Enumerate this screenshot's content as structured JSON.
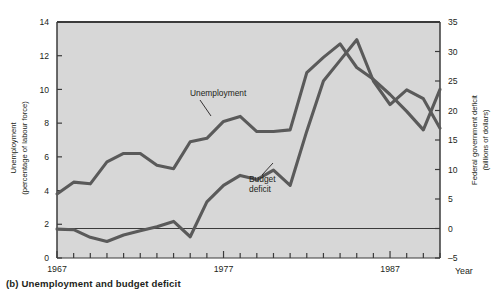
{
  "caption": "(b) Unemployment and budget deficit",
  "chart_data": {
    "type": "line",
    "title": "",
    "xlabel": "Year",
    "left_axis": {
      "label_line1": "Unemployment",
      "label_line2": "(percentage of labour force)",
      "ticks": [
        0,
        2,
        4,
        6,
        8,
        10,
        12,
        14
      ],
      "ylim": [
        0,
        14
      ]
    },
    "right_axis": {
      "label_line1": "Federal government deficit",
      "label_line2": "(billions of dollars)",
      "ticks": [
        -5,
        0,
        5,
        10,
        15,
        20,
        25,
        30,
        35
      ],
      "ylim": [
        -5,
        35
      ]
    },
    "x": [
      1967,
      1968,
      1969,
      1970,
      1971,
      1972,
      1973,
      1974,
      1975,
      1976,
      1977,
      1978,
      1979,
      1980,
      1981,
      1982,
      1983,
      1984,
      1985,
      1986,
      1987,
      1988,
      1989,
      1990
    ],
    "xlim": [
      1967,
      1990
    ],
    "xticklabels": [
      "1967",
      "1977",
      "1987"
    ],
    "xticklabel_years": [
      1967,
      1977,
      1987
    ],
    "grid": false,
    "legend": "inline-annotations",
    "series": [
      {
        "name": "Unemployment",
        "axis": "left",
        "units": "percentage of labour force",
        "annotation": "Unemployment",
        "values": [
          3.8,
          4.5,
          4.4,
          5.7,
          6.2,
          6.2,
          5.5,
          5.3,
          6.9,
          7.1,
          8.1,
          8.4,
          7.5,
          7.5,
          7.6,
          11.0,
          11.9,
          11.3,
          10.5,
          9.6,
          8.8,
          7.8,
          7.5,
          8.1
        ],
        "values_y2": [
          3.8,
          4.5,
          4.4,
          5.7,
          6.2,
          6.2,
          5.5,
          5.3,
          6.9,
          7.1,
          8.1,
          8.4,
          7.5,
          7.5,
          7.6,
          11.0,
          11.9,
          12.7,
          11.3,
          10.6,
          9.7,
          8.7,
          7.6,
          10.0
        ]
      },
      {
        "name": "Budget deficit",
        "axis": "right",
        "units": "billions of dollars",
        "annotation": "Budget deficit",
        "values": [
          -0.1,
          -0.2,
          -1.5,
          -2.2,
          -1.1,
          -0.4,
          0.3,
          1.2,
          -1.4,
          4.5,
          7.3,
          9.0,
          8.3,
          9.9,
          7.3,
          16.5,
          25.0,
          28.5,
          32.0,
          25.0,
          21.0,
          23.5,
          22.0,
          17.0
        ]
      }
    ],
    "zero_reference_line": 0,
    "colors": {
      "plot_background": "#d7d7d7",
      "line": "#5a5a5a",
      "frame": "#3b3b3b",
      "text": "#231f20",
      "page_background": "#ffffff"
    }
  }
}
